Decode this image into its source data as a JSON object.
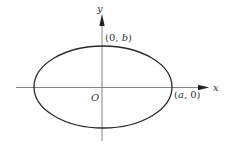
{
  "diagram": {
    "type": "ellipse-on-axes",
    "colors": {
      "stroke": "#2a2a2a",
      "axis": "#555555",
      "text": "#333333",
      "background": "#ffffff"
    },
    "axes": {
      "x_label": "x",
      "y_label": "y",
      "origin_label": "O"
    },
    "points": {
      "top": {
        "label_open": "(0, ",
        "label_var": "b",
        "label_close": ")"
      },
      "right": {
        "label_open": "(",
        "label_var": "a",
        "label_close": ", 0)"
      }
    }
  }
}
